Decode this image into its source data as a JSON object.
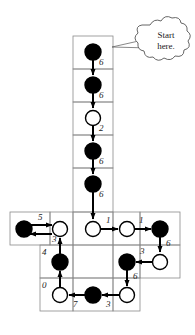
{
  "figure": {
    "callout": {
      "line1": "Start",
      "line2": "here.",
      "target": "start-node"
    },
    "colors": {
      "filled": "#000000",
      "empty": "#ffffff",
      "stroke": "#000000",
      "grid": "#8a8a8a",
      "background": "#ffffff"
    }
  },
  "grid": {
    "columns_x": [
      10,
      50,
      73,
      113,
      140,
      180
    ],
    "rows_y": [
      36,
      69,
      102,
      135,
      168,
      212,
      245,
      278,
      311
    ],
    "cell_width": 40,
    "cell_height": 33
  },
  "nodes": [
    {
      "id": "n1",
      "fill": "filled",
      "cx": 93,
      "cy": 52
    },
    {
      "id": "n2",
      "fill": "filled",
      "cx": 93,
      "cy": 85
    },
    {
      "id": "n3",
      "fill": "empty",
      "cx": 93,
      "cy": 118
    },
    {
      "id": "n4",
      "fill": "filled",
      "cx": 93,
      "cy": 151
    },
    {
      "id": "n5",
      "fill": "filled",
      "cx": 93,
      "cy": 184
    },
    {
      "id": "n6",
      "fill": "empty",
      "cx": 93,
      "cy": 229
    },
    {
      "id": "n7",
      "fill": "empty",
      "cx": 127,
      "cy": 229
    },
    {
      "id": "n8",
      "fill": "filled",
      "cx": 160,
      "cy": 229
    },
    {
      "id": "n9",
      "fill": "empty",
      "cx": 60,
      "cy": 229
    },
    {
      "id": "n10",
      "fill": "filled",
      "cx": 24,
      "cy": 229
    },
    {
      "id": "n11",
      "fill": "filled",
      "cx": 60,
      "cy": 262
    },
    {
      "id": "n12",
      "fill": "filled",
      "cx": 127,
      "cy": 262
    },
    {
      "id": "n13",
      "fill": "empty",
      "cx": 160,
      "cy": 262
    },
    {
      "id": "n14",
      "fill": "empty",
      "cx": 60,
      "cy": 295
    },
    {
      "id": "n15",
      "fill": "filled",
      "cx": 93,
      "cy": 295
    },
    {
      "id": "n16",
      "fill": "empty",
      "cx": 127,
      "cy": 295
    }
  ],
  "arrows": [
    {
      "id": "a1",
      "from": "n1",
      "to": "n2",
      "dir": "down",
      "label": "6",
      "label_x": 99,
      "label_y": 63
    },
    {
      "id": "a2",
      "from": "n2",
      "to": "n3",
      "dir": "down",
      "label": "6",
      "label_x": 99,
      "label_y": 96
    },
    {
      "id": "a3",
      "from": "n3",
      "to": "n4",
      "dir": "down",
      "label": "2",
      "label_x": 99,
      "label_y": 129
    },
    {
      "id": "a4",
      "from": "n4",
      "to": "n5",
      "dir": "down",
      "label": "6",
      "label_x": 99,
      "label_y": 162
    },
    {
      "id": "a5",
      "from": "n5",
      "to": "n6",
      "dir": "down",
      "label": "6",
      "label_x": 99,
      "label_y": 195
    },
    {
      "id": "a6",
      "from": "n6",
      "to": "n7",
      "dir": "right",
      "label": "1",
      "label_x": 108,
      "label_y": 220
    },
    {
      "id": "a7",
      "from": "n7",
      "to": "n8",
      "dir": "right",
      "label": "1",
      "label_x": 141,
      "label_y": 220
    },
    {
      "id": "a8",
      "from": "n8",
      "to": "n13",
      "dir": "down",
      "label": "6",
      "label_x": 167,
      "label_y": 245
    },
    {
      "id": "a9",
      "from": "n13",
      "to": "n12",
      "dir": "left",
      "label": "3",
      "label_x": 140,
      "label_y": 253
    },
    {
      "id": "a10",
      "from": "n12",
      "to": "n16",
      "dir": "down",
      "label": "6",
      "label_x": 133,
      "label_y": 278
    },
    {
      "id": "a11",
      "from": "n16",
      "to": "n15",
      "dir": "left",
      "label": "3",
      "label_x": 107,
      "label_y": 306
    },
    {
      "id": "a12",
      "from": "n15",
      "to": "n14",
      "dir": "left",
      "label": "7",
      "label_x": 74,
      "label_y": 306
    },
    {
      "id": "a13",
      "from": "n14",
      "to": "n11",
      "dir": "up",
      "label": "0",
      "label_x": 43,
      "label_y": 285
    },
    {
      "id": "a14",
      "from": "n11",
      "to": "n9",
      "dir": "up",
      "label": "4",
      "label_x": 43,
      "label_y": 252
    },
    {
      "id": "a15",
      "from": "n10",
      "to": "n9",
      "dir": "right",
      "label": "5",
      "label_x": 39,
      "label_y": 217
    },
    {
      "id": "a16",
      "from": "n9",
      "to": "n10",
      "dir": "left",
      "label": "3",
      "label_x": 53,
      "label_y": 240
    }
  ]
}
